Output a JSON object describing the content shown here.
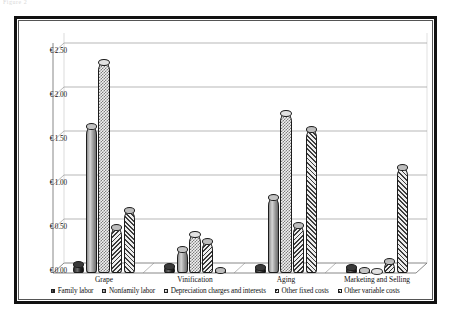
{
  "artifact_text": "Figure 2",
  "chart_data": {
    "type": "bar",
    "title": "",
    "subtitle": "",
    "xlabel": "",
    "ylabel": "",
    "ylim": [
      0,
      2.75
    ],
    "y_ticks": [
      0.0,
      0.5,
      1.0,
      1.5,
      2.0,
      2.5
    ],
    "y_tick_labels": [
      "€ 0.00",
      "€ 0.50",
      "€ 1.00",
      "€ 1.50",
      "€ 2.00",
      "€ 2.50"
    ],
    "currency_symbol": "€",
    "grid": true,
    "grid_axis": "y",
    "legend_position": "bottom",
    "three_d": true,
    "categories": [
      "Grape",
      "Vinification",
      "Aging",
      "Marketing and Selling"
    ],
    "series": [
      {
        "name": "Family labor",
        "pattern": "solid-dark",
        "color": "#2b2b2b",
        "values": [
          0.1,
          0.08,
          0.07,
          0.07
        ]
      },
      {
        "name": "Nonfamily labor",
        "pattern": "solid-grey",
        "color": "#9b9b9b",
        "values": [
          1.67,
          0.27,
          0.86,
          0.01
        ]
      },
      {
        "name": "Depreciation charges and interests",
        "pattern": "checkered",
        "color": "#e2e2e2",
        "values": [
          2.4,
          0.44,
          1.82,
          0.0
        ]
      },
      {
        "name": "Other fixed costs",
        "pattern": "diagonal-hatch-back",
        "color": "#5a5a5a",
        "values": [
          0.52,
          0.36,
          0.54,
          0.14
        ]
      },
      {
        "name": "Other variable costs",
        "pattern": "diagonal-hatch-fwd",
        "color": "#5a5a5a",
        "values": [
          0.72,
          0.03,
          1.64,
          1.2
        ]
      }
    ]
  }
}
